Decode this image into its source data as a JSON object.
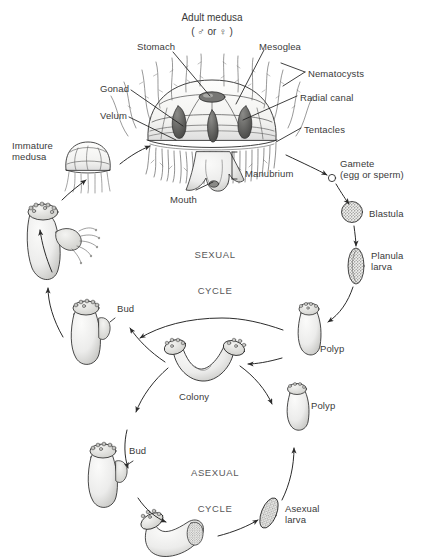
{
  "diagram": {
    "title": "Adult medusa",
    "subtitle": "( ♂ or ♀ )",
    "colors": {
      "ink": "#3a3a3a",
      "line": "#2b2b2b",
      "cycle_text": "#58585a",
      "shade_light": "#e8e8e6",
      "shade_mid": "#b9b9b6",
      "shade_dark": "#6e6e6c",
      "background": "#ffffff"
    }
  },
  "anatomy_labels": [
    {
      "id": "stomach",
      "text": "Stomach",
      "x": 137,
      "y": 41,
      "align": "left"
    },
    {
      "id": "mesoglea",
      "text": "Mesoglea",
      "x": 259,
      "y": 41,
      "align": "left"
    },
    {
      "id": "nematocysts",
      "text": "Nematocysts",
      "x": 308,
      "y": 68,
      "align": "left"
    },
    {
      "id": "gonad",
      "text": "Gonad",
      "x": 100,
      "y": 83,
      "align": "left"
    },
    {
      "id": "radial-canal",
      "text": "Radial canal",
      "x": 300,
      "y": 92,
      "align": "left"
    },
    {
      "id": "velum",
      "text": "Velum",
      "x": 100,
      "y": 110,
      "align": "left"
    },
    {
      "id": "tentacles",
      "text": "Tentacles",
      "x": 304,
      "y": 124,
      "align": "left"
    },
    {
      "id": "manubrium",
      "text": "Manubrium",
      "x": 245,
      "y": 168,
      "align": "left"
    },
    {
      "id": "mouth",
      "text": "Mouth",
      "x": 170,
      "y": 194,
      "align": "left"
    }
  ],
  "cycle_labels": [
    {
      "id": "sexual-cycle",
      "line1": "SEXUAL",
      "line2": "CYCLE",
      "x": 215,
      "y": 225
    },
    {
      "id": "asexual-cycle",
      "line1": "ASEXUAL",
      "line2": "CYCLE",
      "x": 213,
      "y": 443
    }
  ],
  "stage_labels": [
    {
      "id": "immature-medusa",
      "text": "Immature\nmedusa",
      "x": 12,
      "y": 140,
      "align": "left"
    },
    {
      "id": "gamete",
      "text": "Gamete\n(egg or sperm)",
      "x": 340,
      "y": 158,
      "align": "left"
    },
    {
      "id": "blastula",
      "text": "Blastula",
      "x": 369,
      "y": 208,
      "align": "left"
    },
    {
      "id": "planula-larva",
      "text": "Planula\nlarva",
      "x": 371,
      "y": 250,
      "align": "left"
    },
    {
      "id": "bud-upper",
      "text": "Bud",
      "x": 117,
      "y": 303,
      "align": "left"
    },
    {
      "id": "polyp-upper",
      "text": "Polyp",
      "x": 320,
      "y": 343,
      "align": "left"
    },
    {
      "id": "colony",
      "text": "Colony",
      "x": 179,
      "y": 391,
      "align": "left"
    },
    {
      "id": "polyp-lower",
      "text": "Polyp",
      "x": 311,
      "y": 400,
      "align": "left"
    },
    {
      "id": "bud-lower",
      "text": "Bud",
      "x": 129,
      "y": 445,
      "align": "left"
    },
    {
      "id": "asexual-larva",
      "text": "Asexual\nlarva",
      "x": 285,
      "y": 503,
      "align": "left"
    }
  ]
}
